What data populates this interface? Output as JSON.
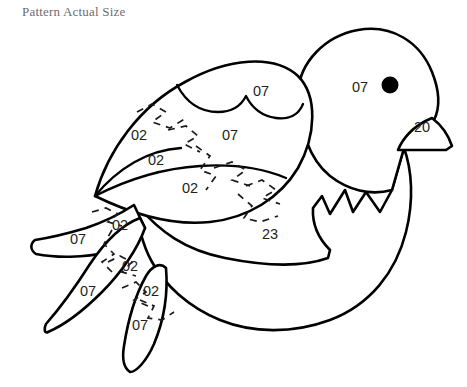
{
  "document": {
    "title": "Pattern Actual Size",
    "background_color": "#ffffff",
    "ink_color": "#000000",
    "title_color": "#6f6b70",
    "subject": "bird applique pattern"
  },
  "pattern": {
    "name": "bird-applique-pattern",
    "pieces": [
      {
        "id": "head",
        "label": "07",
        "x": 360,
        "y": 88,
        "name": "piece-label-head"
      },
      {
        "id": "beak",
        "label": "20",
        "x": 422,
        "y": 128,
        "name": "piece-label-beak"
      },
      {
        "id": "wing-upper",
        "label": "07",
        "x": 261,
        "y": 92,
        "name": "piece-label-wing-upper"
      },
      {
        "id": "wing-middle",
        "label": "07",
        "x": 230,
        "y": 136,
        "name": "piece-label-wing-middle"
      },
      {
        "id": "wing-front-top",
        "label": "02",
        "x": 139,
        "y": 136,
        "name": "piece-label-wing-front-top"
      },
      {
        "id": "wing-front-mid",
        "label": "02",
        "x": 156,
        "y": 161,
        "name": "piece-label-wing-front-mid"
      },
      {
        "id": "wing-lower",
        "label": "02",
        "x": 190,
        "y": 189,
        "name": "piece-label-wing-lower"
      },
      {
        "id": "body",
        "label": "23",
        "x": 270,
        "y": 235,
        "name": "piece-label-body"
      },
      {
        "id": "tail-top-02",
        "label": "02",
        "x": 120,
        "y": 226,
        "name": "piece-label-tail-top-02"
      },
      {
        "id": "tail-top-07",
        "label": "07",
        "x": 78,
        "y": 240,
        "name": "piece-label-tail-top-07"
      },
      {
        "id": "tail-mid-02",
        "label": "02",
        "x": 130,
        "y": 267,
        "name": "piece-label-tail-mid-02"
      },
      {
        "id": "tail-mid-07",
        "label": "07",
        "x": 88,
        "y": 292,
        "name": "piece-label-tail-mid-07"
      },
      {
        "id": "tail-low-02",
        "label": "02",
        "x": 151,
        "y": 292,
        "name": "piece-label-tail-low-02"
      },
      {
        "id": "tail-low-07",
        "label": "07",
        "x": 140,
        "y": 326,
        "name": "piece-label-tail-low-07"
      }
    ],
    "eye": {
      "cx": 390,
      "cy": 85,
      "r": 8.5,
      "color": "#000000"
    }
  }
}
